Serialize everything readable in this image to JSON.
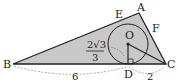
{
  "diagram": {
    "points": {
      "A": "A",
      "B": "B",
      "C": "C",
      "D": "D",
      "E": "E",
      "F": "F",
      "O": "O"
    },
    "labels": {
      "BD": "6",
      "DC": "2",
      "radius_num": "2√3",
      "radius_den": "3"
    },
    "colors": {
      "fill": "#c8c8c8",
      "stroke": "#222222"
    }
  }
}
